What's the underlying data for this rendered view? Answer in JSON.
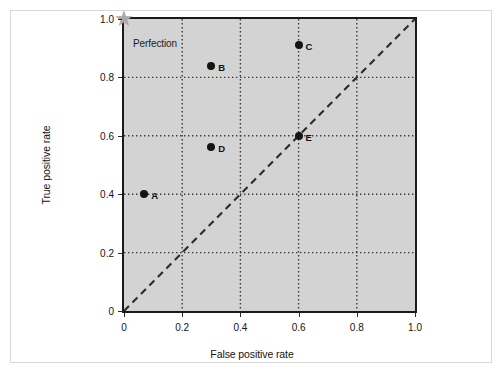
{
  "figure": {
    "background": "#ffffff",
    "frame_color": "#d8d8d8",
    "plot_background": "#d3d3d3",
    "plot_border_color": "#1a1a1a",
    "gridline_color": "#3a3a3a",
    "marker_color": "#141414",
    "star_color": "#a9a9a9",
    "diagonal_color": "#2b2b2b"
  },
  "chart_data": {
    "type": "scatter",
    "title": "",
    "xlabel": "False positive rate",
    "ylabel": "True positive rate",
    "xlim": [
      0,
      1.0
    ],
    "ylim": [
      0,
      1.0
    ],
    "xticks": [
      0,
      0.2,
      0.4,
      0.6,
      0.8,
      1.0
    ],
    "yticks": [
      0,
      0.2,
      0.4,
      0.6,
      0.8,
      1.0
    ],
    "xtick_labels": [
      "0",
      "0.2",
      "0.4",
      "0.6",
      "0.8",
      "1.0"
    ],
    "ytick_labels": [
      "0",
      "0.2",
      "0.4",
      "0.6",
      "0.8",
      "1.0"
    ],
    "grid": true,
    "grid_style": "dotted",
    "legend": null,
    "points": [
      {
        "label": "A",
        "x": 0.07,
        "y": 0.4
      },
      {
        "label": "B",
        "x": 0.3,
        "y": 0.84
      },
      {
        "label": "C",
        "x": 0.6,
        "y": 0.91
      },
      {
        "label": "D",
        "x": 0.3,
        "y": 0.56
      },
      {
        "label": "E",
        "x": 0.6,
        "y": 0.6
      }
    ],
    "annotations": [
      {
        "name": "perfection",
        "label": "Perfection",
        "x": 0.0,
        "y": 1.0,
        "marker": "star"
      }
    ],
    "reference_line": {
      "name": "chance-diagonal",
      "style": "dashed",
      "from": [
        0,
        0
      ],
      "to": [
        1.0,
        1.0
      ]
    }
  },
  "icons": {
    "star": "★"
  }
}
